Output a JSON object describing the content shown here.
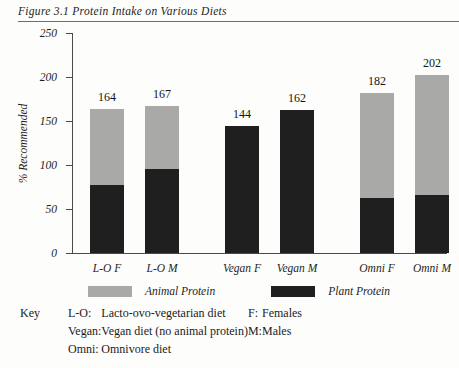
{
  "figure": {
    "title": "Figure 3.1 Protein Intake on Various Diets"
  },
  "chart_data": {
    "type": "bar",
    "title": "Figure 3.1 Protein Intake on Various Diets",
    "xlabel": "",
    "ylabel": "% Recommended",
    "ylim": [
      0,
      250
    ],
    "yticks": [
      0,
      50,
      100,
      150,
      200,
      250
    ],
    "grid": false,
    "stacked": true,
    "legend_position": "below-axis",
    "categories": [
      "L-O F",
      "L-O M",
      "Vegan F",
      "Vegan M",
      "Omni F",
      "Omni M"
    ],
    "totals": [
      164,
      167,
      144,
      162,
      182,
      202
    ],
    "series": [
      {
        "name": "Plant Protein",
        "color": "#1f1f1f",
        "values": [
          77,
          95,
          144,
          162,
          62,
          66
        ]
      },
      {
        "name": "Animal Protein",
        "color": "#a9a9a7",
        "values": [
          87,
          72,
          0,
          0,
          120,
          136
        ]
      }
    ],
    "bars": [
      {
        "category": "L-O F",
        "total": 164,
        "plant": 77,
        "animal": 87
      },
      {
        "category": "L-O M",
        "total": 167,
        "plant": 95,
        "animal": 72
      },
      {
        "category": "Vegan F",
        "total": 144,
        "plant": 144,
        "animal": 0
      },
      {
        "category": "Vegan M",
        "total": 162,
        "plant": 162,
        "animal": 0
      },
      {
        "category": "Omni F",
        "total": 182,
        "plant": 62,
        "animal": 120
      },
      {
        "category": "Omni M",
        "total": 202,
        "plant": 66,
        "animal": 136
      }
    ]
  },
  "axis": {
    "y_label": "% Recommended",
    "y_ticks": [
      "250",
      "200",
      "150",
      "100",
      "50",
      "0"
    ]
  },
  "legend": {
    "items": [
      {
        "label": "Animal Protein",
        "color": "#a9a9a7"
      },
      {
        "label": "Plant Protein",
        "color": "#1f1f1f"
      }
    ]
  },
  "key": {
    "title": "Key",
    "rows": [
      {
        "abbr": "L-O:",
        "definition": "Lacto-ovo-vegetarian diet",
        "abbr2": "F:",
        "definition2": "Females"
      },
      {
        "abbr": "Vegan:",
        "definition": "Vegan diet (no animal protein)",
        "abbr2": "M:",
        "definition2": "Males"
      },
      {
        "abbr": "Omni:",
        "definition": "Omnivore diet",
        "abbr2": "",
        "definition2": ""
      }
    ]
  }
}
